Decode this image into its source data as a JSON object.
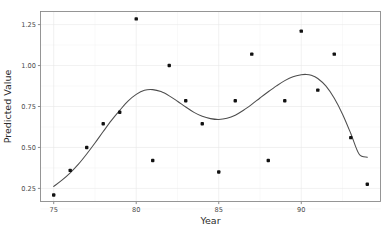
{
  "chart_data": {
    "type": "scatter",
    "title": "",
    "xlabel": "Year",
    "ylabel": "Predicted Value",
    "xlim": [
      74.2,
      94.8
    ],
    "ylim": [
      0.17,
      1.33
    ],
    "xticks": [
      75,
      80,
      85,
      90
    ],
    "xticklabels": [
      "75",
      "80",
      "85",
      "90"
    ],
    "yticks": [
      0.25,
      0.5,
      0.75,
      1.0,
      1.25
    ],
    "yticklabels": [
      "0.25",
      "0.50",
      "0.75",
      "1.00",
      "1.25"
    ],
    "grid": true,
    "legend": "none",
    "point_color": "#111111",
    "line_color": "#4d4d4d",
    "panel_background": "#ffffff",
    "gridline_color": "#e8e8e8",
    "x": [
      75,
      76,
      77,
      78,
      79,
      80,
      81,
      82,
      83,
      84,
      85,
      86,
      87,
      88,
      89,
      90,
      91,
      92,
      93,
      94
    ],
    "y": [
      0.21,
      0.36,
      0.5,
      0.645,
      0.715,
      1.285,
      0.42,
      1.0,
      0.785,
      0.645,
      0.35,
      0.785,
      1.07,
      0.42,
      0.785,
      1.21,
      0.85,
      1.07,
      0.56,
      0.275
    ],
    "series": [
      {
        "name": "observed",
        "type": "scatter",
        "points": [
          {
            "x": 75,
            "y": 0.21
          },
          {
            "x": 76,
            "y": 0.36
          },
          {
            "x": 77,
            "y": 0.5
          },
          {
            "x": 78,
            "y": 0.645
          },
          {
            "x": 79,
            "y": 0.715
          },
          {
            "x": 80,
            "y": 1.285
          },
          {
            "x": 81,
            "y": 0.42
          },
          {
            "x": 82,
            "y": 1.0
          },
          {
            "x": 83,
            "y": 0.785
          },
          {
            "x": 84,
            "y": 0.645
          },
          {
            "x": 85,
            "y": 0.35
          },
          {
            "x": 86,
            "y": 0.785
          },
          {
            "x": 87,
            "y": 1.07
          },
          {
            "x": 88,
            "y": 0.42
          },
          {
            "x": 89,
            "y": 0.785
          },
          {
            "x": 90,
            "y": 1.21
          },
          {
            "x": 91,
            "y": 0.85
          },
          {
            "x": 92,
            "y": 1.07
          },
          {
            "x": 93,
            "y": 0.56
          },
          {
            "x": 94,
            "y": 0.275
          }
        ]
      },
      {
        "name": "fitted-curve",
        "type": "line",
        "points": [
          {
            "x": 75.0,
            "y": 0.262
          },
          {
            "x": 75.5,
            "y": 0.3
          },
          {
            "x": 76.0,
            "y": 0.345
          },
          {
            "x": 76.5,
            "y": 0.398
          },
          {
            "x": 77.0,
            "y": 0.46
          },
          {
            "x": 77.5,
            "y": 0.527
          },
          {
            "x": 78.0,
            "y": 0.597
          },
          {
            "x": 78.5,
            "y": 0.665
          },
          {
            "x": 79.0,
            "y": 0.726
          },
          {
            "x": 79.5,
            "y": 0.783
          },
          {
            "x": 80.0,
            "y": 0.824
          },
          {
            "x": 80.5,
            "y": 0.849
          },
          {
            "x": 81.0,
            "y": 0.853
          },
          {
            "x": 81.5,
            "y": 0.841
          },
          {
            "x": 82.0,
            "y": 0.815
          },
          {
            "x": 82.5,
            "y": 0.782
          },
          {
            "x": 83.0,
            "y": 0.747
          },
          {
            "x": 83.5,
            "y": 0.714
          },
          {
            "x": 84.0,
            "y": 0.69
          },
          {
            "x": 84.5,
            "y": 0.676
          },
          {
            "x": 85.0,
            "y": 0.671
          },
          {
            "x": 85.5,
            "y": 0.678
          },
          {
            "x": 86.0,
            "y": 0.697
          },
          {
            "x": 86.5,
            "y": 0.727
          },
          {
            "x": 87.0,
            "y": 0.763
          },
          {
            "x": 87.5,
            "y": 0.802
          },
          {
            "x": 88.0,
            "y": 0.84
          },
          {
            "x": 88.5,
            "y": 0.876
          },
          {
            "x": 89.0,
            "y": 0.908
          },
          {
            "x": 89.5,
            "y": 0.932
          },
          {
            "x": 90.0,
            "y": 0.944
          },
          {
            "x": 90.3,
            "y": 0.946
          },
          {
            "x": 90.6,
            "y": 0.941
          },
          {
            "x": 91.0,
            "y": 0.921
          },
          {
            "x": 91.5,
            "y": 0.874
          },
          {
            "x": 92.0,
            "y": 0.8
          },
          {
            "x": 92.5,
            "y": 0.703
          },
          {
            "x": 93.0,
            "y": 0.585
          },
          {
            "x": 93.5,
            "y": 0.46
          },
          {
            "x": 94.0,
            "y": 0.44
          }
        ]
      }
    ],
    "annotations": []
  },
  "axis": {
    "x_title": "Year",
    "y_title": "Predicted Value"
  }
}
